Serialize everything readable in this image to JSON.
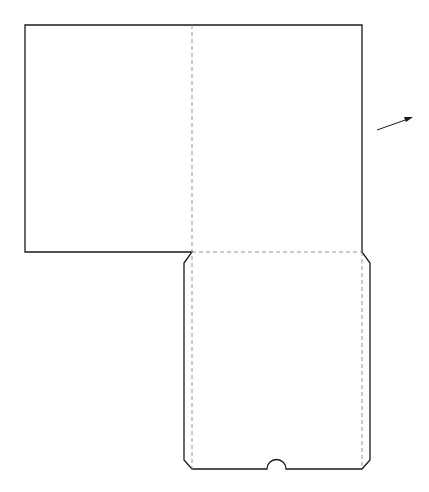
{
  "diagram": {
    "type": "folder-pocket-template",
    "colors": {
      "cut_line": "#1a1a1a",
      "fold_line": "#8a8a8a",
      "background": "#ffffff"
    },
    "legend": {
      "cut_line": "solid",
      "fold_line": "dashed"
    },
    "parts": [
      "top-cover-panel",
      "vertical-spine-fold",
      "pocket-panel",
      "pocket-fold-line",
      "thumb-notch",
      "direction-arrow"
    ]
  }
}
